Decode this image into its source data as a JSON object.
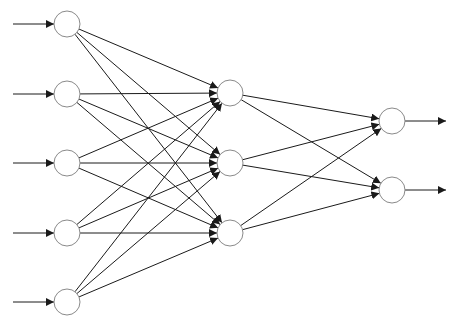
{
  "diagram": {
    "type": "feedforward-neural-network",
    "colors": {
      "background": "#ffffff",
      "node_stroke": "#8a8a8a",
      "node_fill": "#ffffff",
      "edge": "#1a1a1a"
    },
    "node_radius": 13,
    "layers": [
      {
        "name": "input",
        "nodes": [
          {
            "x": 67,
            "y": 24
          },
          {
            "x": 67,
            "y": 94
          },
          {
            "x": 67,
            "y": 163
          },
          {
            "x": 67,
            "y": 233
          },
          {
            "x": 67,
            "y": 302
          }
        ]
      },
      {
        "name": "hidden",
        "nodes": [
          {
            "x": 230,
            "y": 93
          },
          {
            "x": 230,
            "y": 163
          },
          {
            "x": 230,
            "y": 233
          }
        ]
      },
      {
        "name": "output",
        "nodes": [
          {
            "x": 392,
            "y": 121
          },
          {
            "x": 392,
            "y": 190
          }
        ]
      }
    ],
    "input_arrow": {
      "x_start": 13
    },
    "output_arrow": {
      "x_end": 446
    },
    "fully_connected": true
  }
}
